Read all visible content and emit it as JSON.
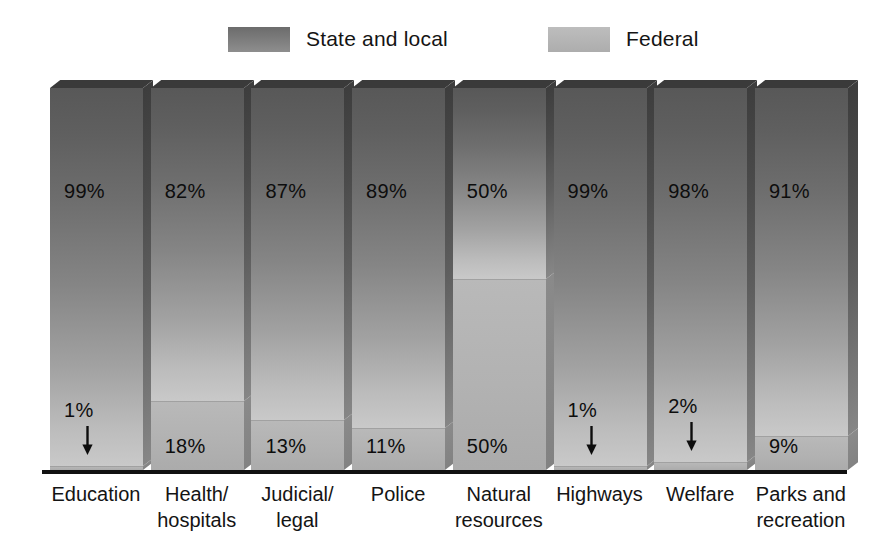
{
  "legend": {
    "entries": [
      {
        "label": "State and local",
        "swatch": "state",
        "color": "#6c6c6c"
      },
      {
        "label": "Federal",
        "swatch": "federal",
        "color": "#bdbdbd"
      }
    ]
  },
  "axis": {
    "baseline_color": "#111111"
  },
  "chart_data": {
    "type": "bar",
    "subtype": "stacked-100-percent-3d",
    "title": "",
    "subtitle": "",
    "xlabel": "",
    "ylabel": "",
    "ylim": [
      0,
      100
    ],
    "grid": false,
    "legend_position": "top",
    "categories": [
      "Education",
      "Health/ hospitals",
      "Judicial/ legal",
      "Police",
      "Natural resources",
      "Highways",
      "Welfare",
      "Parks and recreation"
    ],
    "category_lines": [
      [
        "Education",
        ""
      ],
      [
        "Health/",
        "hospitals"
      ],
      [
        "Judicial/",
        "legal"
      ],
      [
        "Police",
        ""
      ],
      [
        "Natural",
        "resources"
      ],
      [
        "Highways",
        ""
      ],
      [
        "Welfare",
        ""
      ],
      [
        "Parks and",
        "recreation"
      ]
    ],
    "series": [
      {
        "name": "State and local",
        "values": [
          99,
          82,
          87,
          89,
          50,
          99,
          98,
          91
        ]
      },
      {
        "name": "Federal",
        "values": [
          1,
          18,
          13,
          11,
          50,
          1,
          2,
          9
        ]
      }
    ],
    "data_labels": {
      "state": [
        "99%",
        "82%",
        "87%",
        "89%",
        "50%",
        "99%",
        "98%",
        "91%"
      ],
      "federal": [
        "1%",
        "18%",
        "13%",
        "11%",
        "50%",
        "1%",
        "2%",
        "9%"
      ]
    },
    "federal_label_has_arrow": [
      true,
      false,
      false,
      false,
      false,
      true,
      true,
      false
    ]
  }
}
